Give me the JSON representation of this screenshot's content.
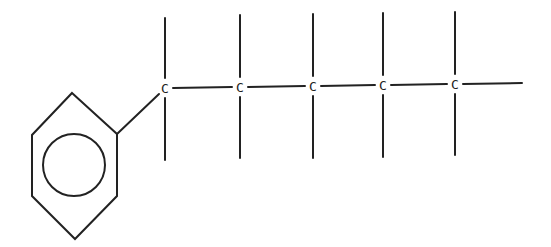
{
  "diagram": {
    "type": "chemical-structure",
    "ring": {
      "kind": "benzene",
      "vertices": [
        [
          72,
          93
        ],
        [
          117,
          134
        ],
        [
          117,
          196
        ],
        [
          75,
          239
        ],
        [
          32,
          196
        ],
        [
          32,
          135
        ]
      ],
      "inner_circle": {
        "cx": 74,
        "cy": 165,
        "r": 31
      }
    },
    "ring_bond": {
      "from": [
        117,
        134
      ],
      "to": [
        159,
        94
      ]
    },
    "carbons": [
      {
        "label": "C",
        "x": 165,
        "y": 88,
        "top": 18,
        "bottom": 160
      },
      {
        "label": "C",
        "x": 240,
        "y": 87,
        "top": 15,
        "bottom": 158
      },
      {
        "label": "C",
        "x": 313,
        "y": 86,
        "top": 14,
        "bottom": 158
      },
      {
        "label": "C",
        "x": 383,
        "y": 85,
        "top": 13,
        "bottom": 157
      },
      {
        "label": "C",
        "x": 455,
        "y": 84,
        "top": 12,
        "bottom": 155
      }
    ],
    "terminal_bond_end_x": 522,
    "line_color": "#222222"
  }
}
